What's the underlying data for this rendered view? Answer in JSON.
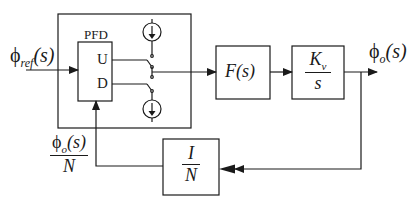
{
  "diagram": {
    "input_label": {
      "symbol": "ϕ",
      "sub": "ref",
      "arg": "(s)"
    },
    "output_label": {
      "symbol": "ϕ",
      "sub": "o",
      "arg": "(s)"
    },
    "pfd": {
      "label": "PFD",
      "up": "U",
      "down": "D"
    },
    "charge_pump": {
      "source_icon": "current-source-down",
      "sink_icon": "current-source-down"
    },
    "filter": {
      "label": "F(s)"
    },
    "vco": {
      "numerator": "K",
      "numerator_sub": "v",
      "denominator": "s"
    },
    "divider": {
      "numerator": "I",
      "denominator": "N"
    },
    "feedback_label": {
      "symbol": "ϕ",
      "sub": "o",
      "arg": "(s)",
      "denominator": "N"
    },
    "colors": {
      "stroke": "#1a1a1a",
      "background": "#ffffff"
    }
  }
}
